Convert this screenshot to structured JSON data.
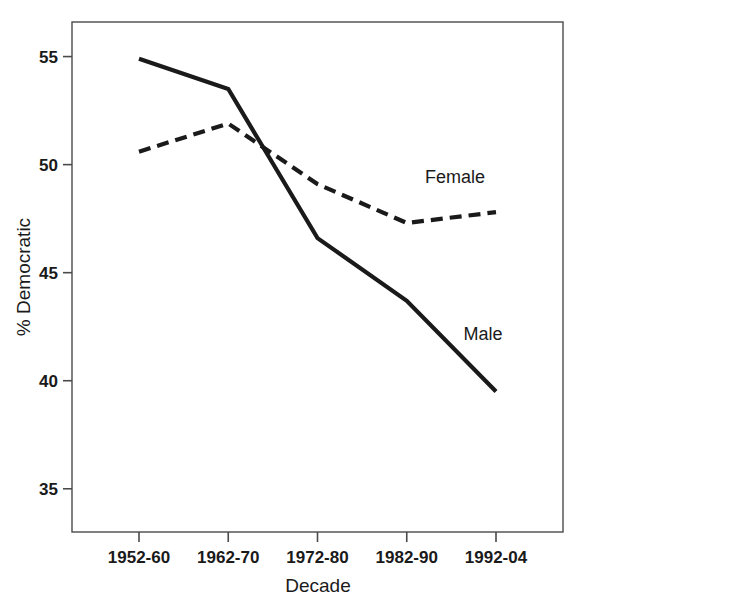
{
  "chart_data": {
    "type": "line",
    "title": "",
    "xlabel": "Decade",
    "ylabel": "% Democratic",
    "categories": [
      "1952-60",
      "1962-70",
      "1972-80",
      "1982-90",
      "1992-04"
    ],
    "series": [
      {
        "name": "Male",
        "style": "solid",
        "color": "#1a1a1a",
        "values": [
          54.9,
          53.5,
          46.6,
          43.7,
          39.5
        ]
      },
      {
        "name": "Female",
        "style": "dashed",
        "color": "#1a1a1a",
        "values": [
          50.6,
          51.9,
          49.1,
          47.3,
          47.8
        ]
      }
    ],
    "ylim": [
      33.0,
      56.6
    ],
    "yticks": [
      35,
      40,
      45,
      50,
      55
    ],
    "ytick_labels": [
      "35",
      "40",
      "45",
      "50",
      "55"
    ],
    "xtick_labels": [
      "1952-60",
      "1962-70",
      "1972-80",
      "1982-90",
      "1992-04"
    ],
    "grid": false,
    "legend": "inline-annotations",
    "annotations": [
      {
        "text": "Female",
        "series": "Female",
        "x_px": 455,
        "y_px": 183
      },
      {
        "text": "Male",
        "series": "Male",
        "x_px": 483,
        "y_px": 340
      }
    ],
    "plot_box": {
      "left": 72,
      "top": 22,
      "right": 563,
      "bottom": 532
    },
    "axis_color": "#4a4a4a"
  }
}
